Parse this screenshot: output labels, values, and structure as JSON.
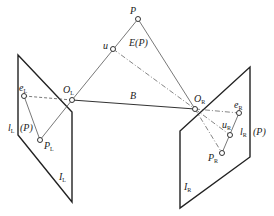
{
  "figure": {
    "labels": {
      "P": "P",
      "u": "u",
      "E_P": "E(P)",
      "O_L": {
        "main": "O",
        "sub": "L"
      },
      "O_R": {
        "main": "O",
        "sub": "R"
      },
      "B": "B",
      "e_L": {
        "main": "e",
        "sub": "L"
      },
      "e_R": {
        "main": "e",
        "sub": "R"
      },
      "P_L": {
        "main": "P",
        "sub": "L"
      },
      "P_R": {
        "main": "P",
        "sub": "R"
      },
      "u_R": {
        "main": "u",
        "sub": "R"
      },
      "l_L": {
        "main": "l",
        "sub": "L"
      },
      "l_R": {
        "main": "l",
        "sub": "R"
      },
      "I_L": {
        "main": "I",
        "sub": "L"
      },
      "I_R": {
        "main": "I",
        "sub": "R"
      },
      "paren_P_left": "(P)",
      "paren_P_right": "(P)"
    }
  }
}
